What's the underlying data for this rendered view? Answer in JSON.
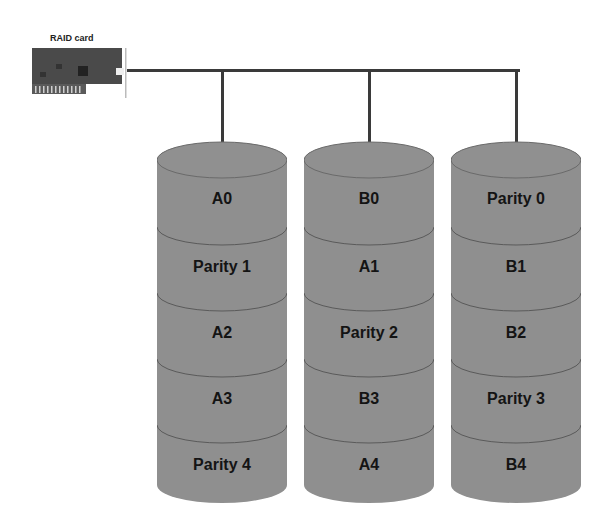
{
  "raid_card": {
    "label": "RAID card"
  },
  "colors": {
    "disk_fill": "#8f8f8f",
    "disk_line": "#5a5a5a",
    "bus": "#3a3a3a",
    "text": "#141414"
  },
  "disks": [
    {
      "name": "Disk 1",
      "blocks": [
        "A0",
        "Parity 1",
        "A2",
        "A3",
        "Parity 4"
      ]
    },
    {
      "name": "Disk 2",
      "blocks": [
        "B0",
        "A1",
        "Parity 2",
        "B3",
        "A4"
      ]
    },
    {
      "name": "Disk 3",
      "blocks": [
        "Parity 0",
        "B1",
        "B2",
        "Parity 3",
        "B4"
      ]
    }
  ]
}
